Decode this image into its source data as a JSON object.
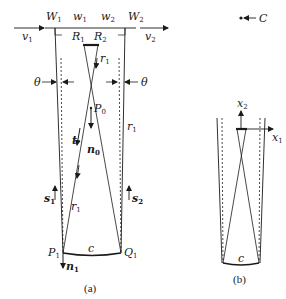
{
  "diagram_a": {
    "caption": "(a)",
    "labels": {
      "W1": "W",
      "W1_sub": "1",
      "w1": "w",
      "w1_sub": "1",
      "w2": "w",
      "w2_sub": "2",
      "W2": "W",
      "W2_sub": "2",
      "v1": "v",
      "v1_sub": "1",
      "v2": "v",
      "v2_sub": "2",
      "R1": "R",
      "R1_sub": "1",
      "R2": "R",
      "R2_sub": "2",
      "r1_top": "r",
      "r1_top_sub": "1",
      "theta_left": "θ",
      "theta_right": "θ",
      "P0": "P",
      "P0_sub": "0",
      "t": "t",
      "n0": "n",
      "n0_sub": "0",
      "r1_right": "r",
      "r1_right_sub": "1",
      "s1": "s",
      "s1_sub": "1",
      "s2": "s",
      "s2_sub": "2",
      "r1_bottom": "r",
      "r1_bottom_sub": "1",
      "P1": "P",
      "P1_sub": "1",
      "Q1": "Q",
      "Q1_sub": "1",
      "c": "c",
      "n1": "n",
      "n1_sub": "1"
    }
  },
  "diagram_b": {
    "caption": "(b)",
    "labels": {
      "C": "C",
      "x2": "x",
      "x2_sub": "2",
      "x1": "x",
      "x1_sub": "1",
      "c": "c"
    }
  }
}
